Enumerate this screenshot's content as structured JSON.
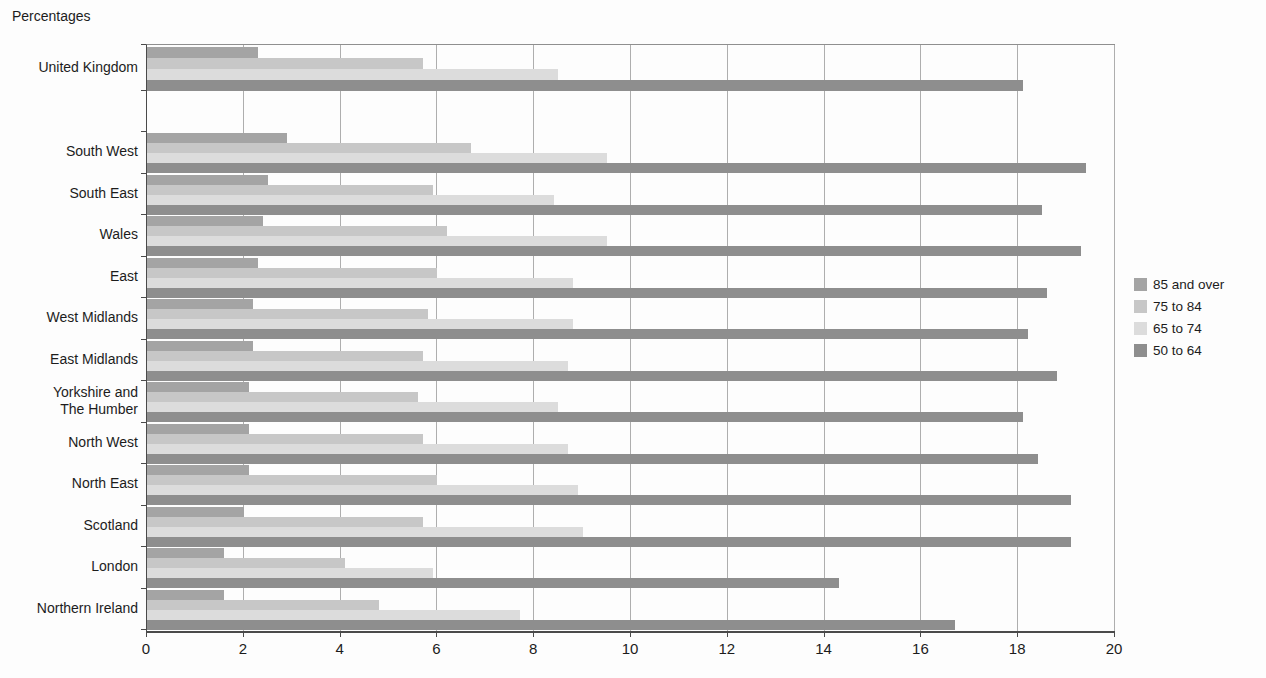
{
  "title": "Percentages",
  "chart_data": {
    "type": "bar",
    "orientation": "horizontal",
    "title": "Percentages",
    "xlabel": "",
    "ylabel": "",
    "xlim": [
      0,
      20
    ],
    "x_ticks": [
      0,
      2,
      4,
      6,
      8,
      10,
      12,
      14,
      16,
      18,
      20
    ],
    "grid": true,
    "legend_position": "right",
    "categories": [
      "United Kingdom",
      "South West",
      "South East",
      "Wales",
      "East",
      "West Midlands",
      "East Midlands",
      "Yorkshire and\nThe Humber",
      "North West",
      "North East",
      "Scotland",
      "London",
      "Northern Ireland"
    ],
    "series": [
      {
        "name": "85 and over",
        "color": "#a4a4a4",
        "values": [
          2.3,
          2.9,
          2.5,
          2.4,
          2.3,
          2.2,
          2.2,
          2.1,
          2.1,
          2.1,
          2.0,
          1.6,
          1.6
        ]
      },
      {
        "name": "75 to 84",
        "color": "#c7c7c7",
        "values": [
          5.7,
          6.7,
          5.9,
          6.2,
          6.0,
          5.8,
          5.7,
          5.6,
          5.7,
          6.0,
          5.7,
          4.1,
          4.8
        ]
      },
      {
        "name": "65 to 74",
        "color": "#dcdcdc",
        "values": [
          8.5,
          9.5,
          8.4,
          9.5,
          8.8,
          8.8,
          8.7,
          8.5,
          8.7,
          8.9,
          9.0,
          5.9,
          7.7
        ]
      },
      {
        "name": "50 to 64",
        "color": "#8e8e8e",
        "values": [
          18.1,
          19.4,
          18.5,
          19.3,
          18.6,
          18.2,
          18.8,
          18.1,
          18.4,
          19.1,
          19.1,
          14.3,
          16.7
        ]
      }
    ]
  },
  "colors": {
    "axis": "#4a4a4a",
    "gridline": "#aeaeae",
    "background": "#fdfdfd"
  }
}
